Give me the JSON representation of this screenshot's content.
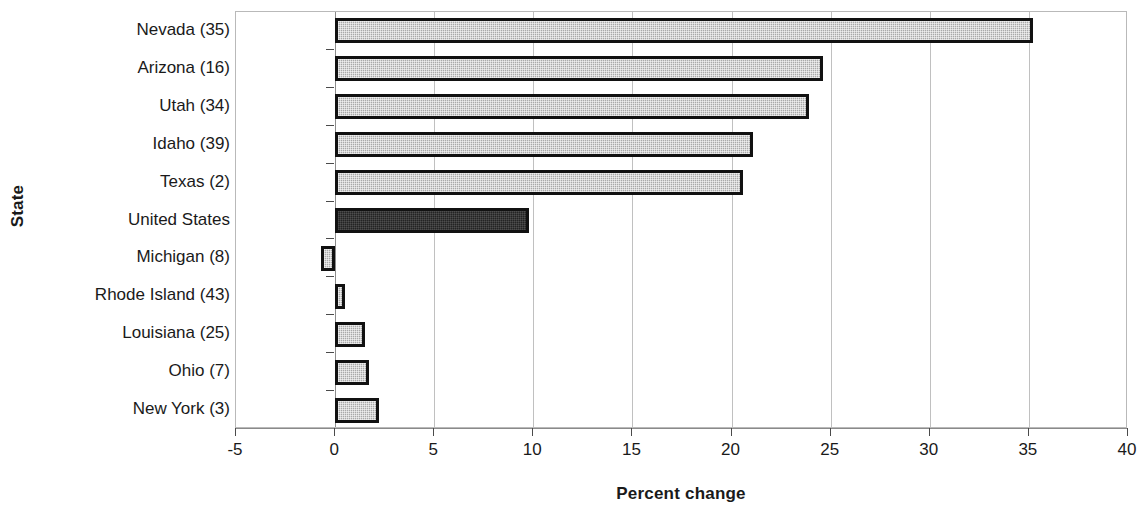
{
  "chart_data": {
    "type": "bar",
    "orientation": "horizontal",
    "title": "",
    "xlabel": "Percent change",
    "ylabel": "State",
    "categories": [
      "Nevada (35)",
      "Arizona (16)",
      "Utah (34)",
      "Idaho (39)",
      "Texas (2)",
      "United States",
      "Michigan (8)",
      "Rhode Island (43)",
      "Louisiana (25)",
      "Ohio (7)",
      "New York (3)"
    ],
    "values": [
      35.2,
      24.6,
      23.9,
      21.1,
      20.6,
      9.8,
      -0.7,
      0.5,
      1.5,
      1.7,
      2.2
    ],
    "highlight_category": "United States",
    "xlim": [
      -5,
      40
    ],
    "xticks": [
      -5,
      0,
      5,
      10,
      15,
      20,
      25,
      30,
      35,
      40
    ],
    "xtick_labels": [
      "-5",
      "0",
      "5",
      "10",
      "15",
      "20",
      "25",
      "30",
      "35",
      "40"
    ],
    "grid": "vertical",
    "legend": "none",
    "colors": {
      "bar_fill": "#a9a9a9",
      "bar_border": "#111111",
      "highlight_fill": "#232323",
      "gridline": "#c0c0c0",
      "axis": "#8a8a8a",
      "text": "#1a1a1a",
      "background": "#ffffff"
    }
  }
}
